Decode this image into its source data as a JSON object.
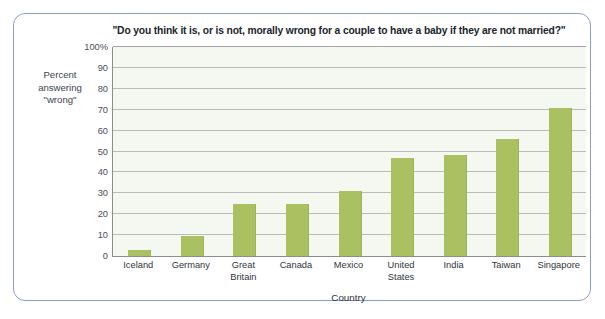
{
  "figure": {
    "frame_color": "#8e9ccb",
    "background": "#ffffff"
  },
  "chart_data": {
    "type": "bar",
    "title": "\"Do you think it is, or is not, morally wrong for a couple to have a baby if they are not married?\"",
    "xlabel": "Country",
    "ylabel": "Percent answering \"wrong\"",
    "ylabel_line1": "Percent",
    "ylabel_line2": "answering",
    "ylabel_line3": "\"wrong\"",
    "categories": [
      "Iceland",
      "Germany",
      "Great Britain",
      "Canada",
      "Mexico",
      "United States",
      "India",
      "Taiwan",
      "Singapore"
    ],
    "category_lines": [
      [
        "Iceland"
      ],
      [
        "Germany"
      ],
      [
        "Great",
        "Britain"
      ],
      [
        "Canada"
      ],
      [
        "Mexico"
      ],
      [
        "United",
        "States"
      ],
      [
        "India"
      ],
      [
        "Taiwan"
      ],
      [
        "Singapore"
      ]
    ],
    "values": [
      3,
      9.5,
      25,
      25,
      31,
      47,
      48.5,
      56,
      71
    ],
    "ylim": [
      0,
      100
    ],
    "yticks": [
      0,
      10,
      20,
      30,
      40,
      50,
      60,
      70,
      80,
      90,
      100
    ],
    "ytick_labels": [
      "0",
      "10",
      "20",
      "30",
      "40",
      "50",
      "60",
      "70",
      "80",
      "90",
      "100%"
    ],
    "bar_color": "#aac061",
    "plot_background": "#f4f8f1",
    "gridline_color": "#b9bcbb",
    "grid": true,
    "legend": false
  }
}
